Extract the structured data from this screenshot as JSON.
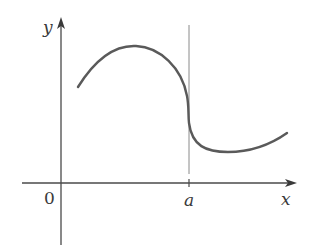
{
  "figure": {
    "axis_labels": {
      "x": "x",
      "y": "y"
    },
    "origin_label": "0",
    "marker_label": "a",
    "colors": {
      "axis": "#4a4a4a",
      "curve": "#5a5a5a",
      "vline": "#8a8a8a",
      "text": "#3a3a3a"
    }
  }
}
